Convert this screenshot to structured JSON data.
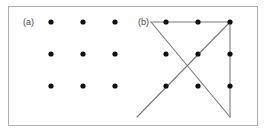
{
  "figure": {
    "type": "diagram",
    "frame": {
      "border_color": "#b0b0b0",
      "background": "#ffffff",
      "x": 8,
      "y": 6,
      "width": 250,
      "height": 120
    },
    "dot_color": "#111111",
    "line_color": "#7a7a7a",
    "dot_radius": 2.6,
    "line_width": 1.1
  },
  "panels": [
    {
      "id": "a",
      "label": "(a)",
      "label_x": 14,
      "label_y": 11,
      "caption_role": "nine-dot-grid",
      "dots": [
        {
          "x": 42,
          "y": 15
        },
        {
          "x": 74,
          "y": 15
        },
        {
          "x": 106,
          "y": 15
        },
        {
          "x": 42,
          "y": 47
        },
        {
          "x": 74,
          "y": 47
        },
        {
          "x": 106,
          "y": 47
        },
        {
          "x": 42,
          "y": 79
        },
        {
          "x": 74,
          "y": 79
        },
        {
          "x": 106,
          "y": 79
        }
      ],
      "lines": []
    },
    {
      "id": "b",
      "label": "(b)",
      "label_x": 9,
      "label_y": 11,
      "caption_role": "four-line-solution",
      "dots": [
        {
          "x": 37,
          "y": 15
        },
        {
          "x": 69,
          "y": 15
        },
        {
          "x": 101,
          "y": 15
        },
        {
          "x": 37,
          "y": 47
        },
        {
          "x": 69,
          "y": 47
        },
        {
          "x": 101,
          "y": 47
        },
        {
          "x": 37,
          "y": 79
        },
        {
          "x": 69,
          "y": 79
        },
        {
          "x": 101,
          "y": 79
        }
      ],
      "lines": [
        {
          "name": "top-horizontal",
          "x1": 22,
          "y1": 15,
          "x2": 101,
          "y2": 15
        },
        {
          "name": "right-vertical",
          "x1": 101,
          "y1": 15,
          "x2": 101,
          "y2": 110
        },
        {
          "name": "diagonal-down-right",
          "x1": 22,
          "y1": 15,
          "x2": 101,
          "y2": 110
        },
        {
          "name": "diagonal-up-right",
          "x1": 8,
          "y1": 110,
          "x2": 101,
          "y2": 15
        }
      ]
    }
  ]
}
